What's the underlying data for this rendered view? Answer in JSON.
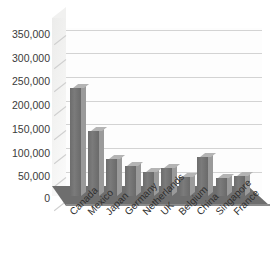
{
  "chart_data": {
    "type": "bar",
    "title": "",
    "subtitle": "",
    "xlabel": "",
    "ylabel": "",
    "categories": [
      "Canada",
      "Mexico",
      "Japan",
      "Germany",
      "Netherlands",
      "UK",
      "Belgium",
      "China",
      "Singapore",
      "France"
    ],
    "values": [
      228000,
      137000,
      78000,
      63000,
      50000,
      60000,
      40000,
      82000,
      38000,
      42000
    ],
    "series": [
      {
        "name": "",
        "values": [
          228000,
          137000,
          78000,
          63000,
          50000,
          60000,
          40000,
          82000,
          38000,
          42000
        ]
      }
    ],
    "ylim": [
      0,
      350000
    ],
    "ytick_values": [
      0,
      50000,
      100000,
      150000,
      200000,
      250000,
      300000,
      350000
    ],
    "ytick_labels": [
      "0",
      "50,000",
      "100,000",
      "150,000",
      "200,000",
      "250,000",
      "300,000",
      "350,000"
    ],
    "grid": true,
    "legend": false,
    "legend_position": "none",
    "style": "3d-column",
    "bar_color": "#6f6f6f",
    "bar_top_color": "#b4b4b4",
    "bar_side_color": "#9a9a9a",
    "gridline_color": "#d3d3d3",
    "floor_color": "#6e6e6e",
    "wall_color": "#f4f4f3",
    "plot_background": "#fdfdfd",
    "annotations": []
  }
}
